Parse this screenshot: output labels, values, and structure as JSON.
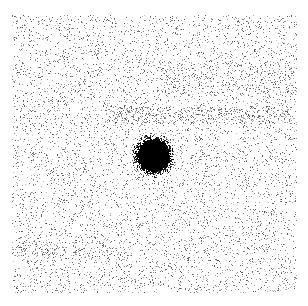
{
  "image": {
    "description": "Grayscale noisy image with a single dark circular spot at center",
    "width": 308,
    "height": 306,
    "background": "#ffffff",
    "ink": "#000000",
    "noise_region": {
      "x0": 12,
      "y0": 15,
      "x1": 296,
      "y1": 292
    },
    "noise_density": 0.085,
    "bands": [
      {
        "y": 107,
        "height": 16,
        "x0": 105,
        "x1": 290,
        "extra_density": 0.12
      },
      {
        "y": 62,
        "height": 30,
        "x0": 160,
        "x1": 296,
        "extra_density": 0.05
      },
      {
        "y": 242,
        "height": 14,
        "x0": 12,
        "x1": 120,
        "extra_density": 0.06
      }
    ],
    "spot": {
      "cx": 153,
      "cy": 155,
      "core_radius": 15,
      "halo_radius": 24
    },
    "seed": 1337
  }
}
